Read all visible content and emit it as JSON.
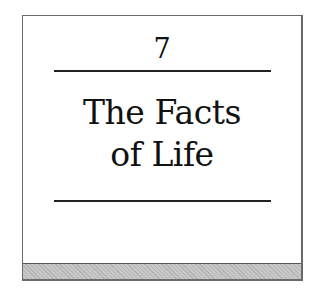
{
  "chapter": {
    "number": "7",
    "title_line1": "The Facts",
    "title_line2": "of Life"
  }
}
